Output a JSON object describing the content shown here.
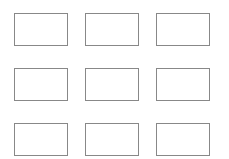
{
  "diagram": {
    "layout": "3x3 grid of empty rectangles",
    "border_color": "#888888",
    "background": "#ffffff",
    "rows": [
      {
        "boxes": [
          {
            "label": ""
          },
          {
            "label": ""
          },
          {
            "label": ""
          }
        ]
      },
      {
        "boxes": [
          {
            "label": ""
          },
          {
            "label": ""
          },
          {
            "label": ""
          }
        ]
      },
      {
        "boxes": [
          {
            "label": ""
          },
          {
            "label": ""
          },
          {
            "label": ""
          }
        ]
      }
    ]
  }
}
